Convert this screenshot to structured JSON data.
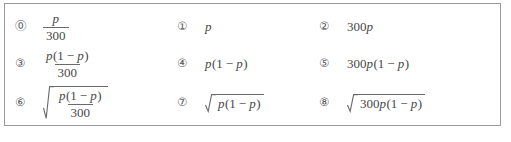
{
  "question_block": {
    "border_color": "#9a9a9a",
    "text_color": "#484848",
    "choices": [
      {
        "marker": "⓪",
        "expression_text": "p/300",
        "numerator": "p",
        "denominator": "300"
      },
      {
        "marker": "①",
        "expression_text": "p",
        "variable": "p"
      },
      {
        "marker": "②",
        "expression_text": "300p",
        "coefficient": "300",
        "variable": "p"
      },
      {
        "marker": "③",
        "expression_text": "p(1-p)/300",
        "numerator": "p(1-p)",
        "denominator": "300"
      },
      {
        "marker": "④",
        "expression_text": "p(1-p)"
      },
      {
        "marker": "⑤",
        "expression_text": "300p(1-p)",
        "coefficient": "300"
      },
      {
        "marker": "⑥",
        "expression_text": "sqrt(p(1-p)/300)",
        "numerator": "p(1-p)",
        "denominator": "300"
      },
      {
        "marker": "⑦",
        "expression_text": "sqrt(p(1-p))"
      },
      {
        "marker": "⑧",
        "expression_text": "sqrt(300p(1-p))",
        "coefficient": "300"
      }
    ],
    "tokens": {
      "var_p": "p",
      "num_300": "300",
      "num_1": "1",
      "minus": "−",
      "paren_open": "(",
      "paren_close": ")"
    }
  },
  "footer": {
    "caption": ""
  }
}
